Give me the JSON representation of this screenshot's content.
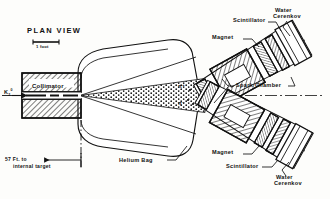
{
  "figure": {
    "domain": "diagram",
    "title": "PLAN VIEW",
    "background_color": "#fdfdfb",
    "ink_color": "#111111"
  },
  "labels": {
    "plan_view": "PLAN VIEW",
    "scale_bar": "1 foot",
    "collimator": "Collimator",
    "beam": "K",
    "beam_sub": "2",
    "beam_sup": "0",
    "distance_line1": "57 Ft. to",
    "distance_line2": "internal target",
    "helium_bag": "Helium Bag",
    "spark_chamber": "Spark Chamber",
    "magnet_top": "Magnet",
    "scintillator_top": "Scintillator",
    "cerenkov_top_line1": "Water",
    "cerenkov_top_line2": "Cerenkov",
    "magnet_bottom": "Magnet",
    "scintillator_bottom": "Scintillator",
    "cerenkov_bottom_line1": "Water",
    "cerenkov_bottom_line2": "Cerenkov",
    "pion_plus": "π⁺",
    "pion_minus": "π⁻"
  },
  "components": [
    {
      "name": "collimator",
      "label": "Collimator",
      "fill": "hatched"
    },
    {
      "name": "helium-bag",
      "label": "Helium Bag",
      "fill": "outline"
    },
    {
      "name": "beam-cone",
      "label": "K2-0 beam",
      "fill": "stippled"
    },
    {
      "name": "magnet-upper-arm",
      "label": "Magnet",
      "fill": "hatched"
    },
    {
      "name": "magnet-lower-arm",
      "label": "Magnet",
      "fill": "hatched"
    },
    {
      "name": "spark-chamber-upper",
      "label": "Spark Chamber",
      "fill": "hatched"
    },
    {
      "name": "spark-chamber-lower",
      "label": "Spark Chamber",
      "fill": "hatched"
    },
    {
      "name": "scintillator-upper",
      "label": "Scintillator",
      "fill": "hatched"
    },
    {
      "name": "scintillator-lower",
      "label": "Scintillator",
      "fill": "hatched"
    },
    {
      "name": "water-cerenkov-upper",
      "label": "Water Cerenkov",
      "fill": "outline"
    },
    {
      "name": "water-cerenkov-lower",
      "label": "Water Cerenkov",
      "fill": "outline"
    }
  ]
}
